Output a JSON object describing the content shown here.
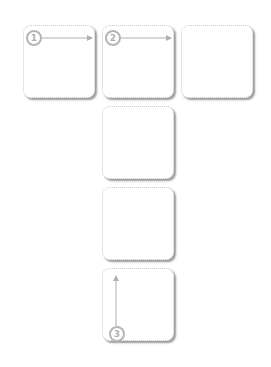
{
  "diagram": {
    "boxes": [
      {
        "id": 1,
        "left": 23,
        "top": 25
      },
      {
        "id": 2,
        "left": 102,
        "top": 25
      },
      {
        "id": 3,
        "left": 181,
        "top": 25
      },
      {
        "id": 4,
        "left": 102,
        "top": 106
      },
      {
        "id": 5,
        "left": 102,
        "top": 187
      },
      {
        "id": 6,
        "left": 102,
        "top": 268
      }
    ],
    "markers": [
      {
        "label": "1",
        "direction": "right"
      },
      {
        "label": "2",
        "direction": "right"
      },
      {
        "label": "3",
        "direction": "up"
      }
    ],
    "colors": {
      "border": "#c8c8c8",
      "shadow": "#9a9a9a",
      "marker": "#b5b5b5",
      "arrow": "#b0b0b0"
    }
  }
}
